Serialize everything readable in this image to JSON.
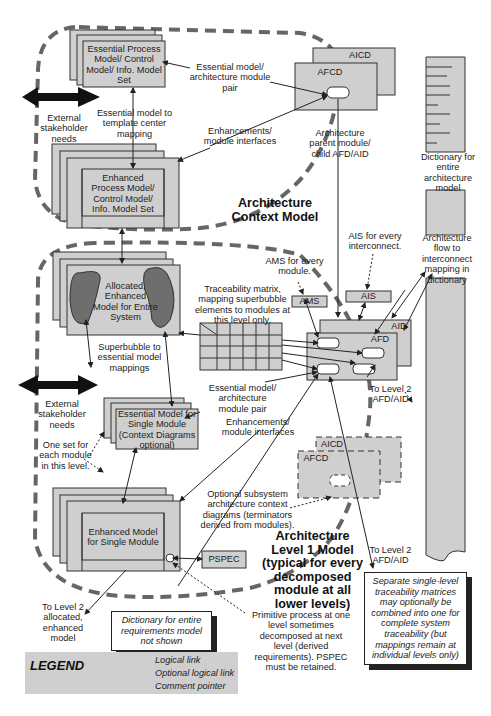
{
  "colors": {
    "box_fill": "#cfcfcf",
    "bubble_fill": "#6e6e6e",
    "outline": "#333333",
    "dash": "#666666"
  },
  "context_model": {
    "title": "Architecture\nContext Model",
    "essential_set": "Essential Process\nModel/ Control\nModel/ Info. Model\nSet",
    "enhanced_set": "Enhanced\nProcess Model/\nControl Model/\nInfo. Model Set",
    "aicd": "AICD",
    "afcd": "AFCD",
    "label_pair": "Essential model/\narchitecture module\npair",
    "label_enh": "Enhancements/\nmodule interfaces",
    "label_template": "Essential model to\ntemplate center\nmapping",
    "label_parent": "Architecture\nparent module/\nchild AFD/AID",
    "stakeholder": "External\nstakeholder\nneeds"
  },
  "dictionary": {
    "label_entire": "Dictionary for\nentire\narchitecture\nmodel",
    "label_flow": "Architecture\nflow to\ninterconnect\nmapping in\ndictionary"
  },
  "level1_model": {
    "title": "Architecture\nLevel 1 Model\n(typical for every\ndecomposed\nmodule at all\nlower levels)",
    "allocated": "Allocated,\nEnhanced\nModel for Entire\nSystem",
    "superbubble": "Superbubble to\nessential model\nmappings",
    "traceability": "Traceability matrix,\nmapping superbubble\nelements to modules at\nthis level only.",
    "ams_note": "AMS for every\nmodule.",
    "ais_note": "AIS for every\ninterconnect.",
    "ams": "AMS",
    "ais": "AIS",
    "aid": "AID",
    "afd": "AFD",
    "to_level2_afd": "To Level 2\nAFD/AID",
    "to_level2_afd_2": "To Level 2\nAFD/AID",
    "label_pair": "Essential model/\narchitecture\nmodule pair",
    "label_enh": "Enhancements/\nmodule interfaces",
    "stakeholder": "External\nstakeholder\nneeds",
    "one_set": "One set for\neach module\nin this level.",
    "essential_single": "Essential Model for\nSingle Module\n(Context Diagrams\noptional)",
    "enhanced_single": "Enhanced Model\nfor Single Module",
    "pspec": "PSPEC",
    "aicd": "AICD",
    "afcd": "AFCD",
    "optional_sub": "Optional subsystem\narchitecture context\ndiagrams (terminators\nderived from modules).",
    "to_level2_alloc": "To Level 2\nallocated,\nenhanced\nmodel",
    "primitive": "Primitive process at one\nlevel sometimes\ndecomposed at next\nlevel (derived\nrequirements). PSPEC\nmust be retained."
  },
  "notes": {
    "dictionary_req": "Dictionary for entire\nrequirements model\nnot shown",
    "separate": "Separate single-level\ntraceability matrices\nmay optionally be\ncombined into one for\ncomplete system\ntraceability (but\nmappings remain at\nindividual levels only)"
  },
  "legend": {
    "title": "LEGEND",
    "items": [
      {
        "label": "Logical link"
      },
      {
        "label": "Optional logical link"
      },
      {
        "label": "Comment pointer"
      }
    ]
  }
}
